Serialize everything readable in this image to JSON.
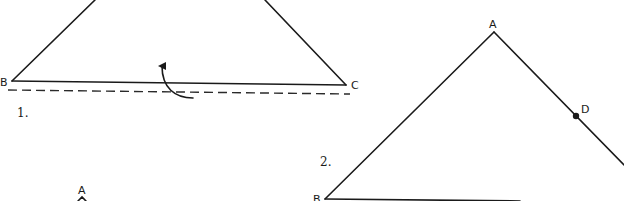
{
  "figures": [
    {
      "step": "1.",
      "vertices": {
        "B": "B",
        "C": "C"
      },
      "description": "Triangle with base BC folded along a dashed line, arrow showing fold direction"
    },
    {
      "step": "2.",
      "vertices": {
        "A": "A",
        "B": "B",
        "D": "D"
      },
      "description": "Triangle ABC with point D marked on side AC"
    },
    {
      "step": "",
      "vertices": {
        "A": "A"
      },
      "description": "Partially visible third figure with vertex A"
    }
  ],
  "colors": {
    "ink": "#1a1a1a",
    "background": "#ffffff"
  }
}
